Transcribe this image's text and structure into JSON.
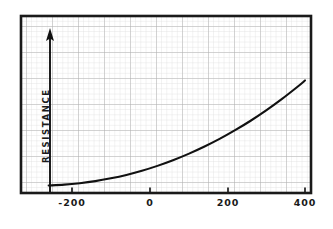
{
  "chart_data": {
    "type": "line",
    "title": "",
    "xlabel": "",
    "ylabel": "RESISTANCE",
    "xlim": [
      -260,
      400
    ],
    "ylim": [
      0,
      100
    ],
    "xticks": [
      -200,
      0,
      200,
      400
    ],
    "xtick_labels": [
      "-200",
      "0",
      "200",
      "400"
    ],
    "yticks": [],
    "ytick_labels": [],
    "grid": true,
    "grid_minor_spacing": 5,
    "grid_major_every": 5,
    "legend": null,
    "series": [
      {
        "name": "resistance",
        "x": [
          -260,
          -220,
          -180,
          -140,
          -100,
          -60,
          -20,
          20,
          60,
          100,
          140,
          180,
          220,
          260,
          300,
          340,
          380,
          400
        ],
        "y": [
          3.0,
          3.6,
          4.6,
          6.0,
          7.9,
          10.2,
          13.0,
          16.3,
          20.1,
          24.4,
          29.2,
          34.5,
          40.4,
          46.8,
          53.8,
          61.4,
          69.6,
          74.0
        ]
      }
    ],
    "annotations": [
      {
        "name": "resistance-axis-arrow",
        "text": "",
        "orientation": "vertical-up",
        "at_x": -235
      }
    ]
  },
  "axis_labels": {
    "x": [
      {
        "value": -200,
        "label": "-200"
      },
      {
        "value": 0,
        "label": "0"
      },
      {
        "value": 200,
        "label": "200"
      },
      {
        "value": 400,
        "label": "400"
      }
    ],
    "y_axis_title": "RESISTANCE"
  },
  "colors": {
    "background": "#ffffff",
    "frame": "#1a1a1a",
    "curve": "#111111",
    "grid_minor": "#d8d8d8",
    "grid_major": "#b0b0b0",
    "text": "#1a1a1a",
    "axis_arrow": "#111111"
  }
}
